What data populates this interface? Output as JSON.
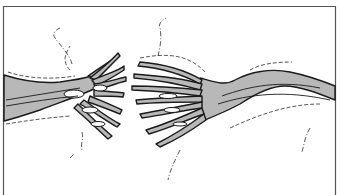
{
  "figure": {
    "colors": {
      "background": "#ffffff",
      "channel_fill": "#b8b8b8",
      "outline": "#1a1a1a",
      "frame": "#555555"
    },
    "frame": {
      "left": 3,
      "top": 6,
      "right": 335
    }
  }
}
